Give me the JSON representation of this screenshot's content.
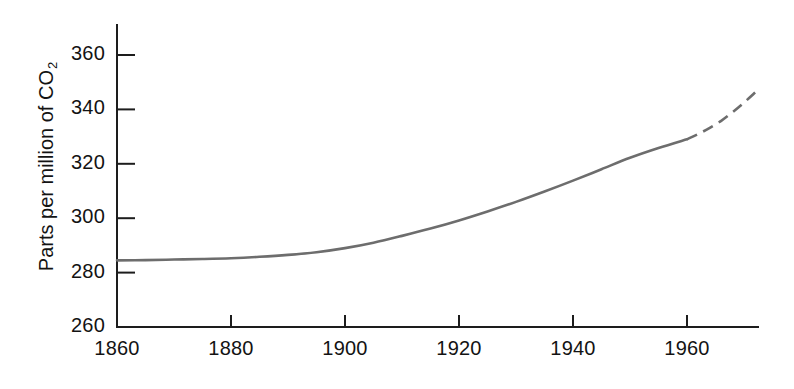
{
  "figure": {
    "background_color": "#ffffff",
    "axis_color": "#1d1d1d",
    "series_color": "#6d6d6d"
  },
  "chart_data": {
    "type": "line",
    "title": "",
    "subtitle": "",
    "xlabel": "",
    "ylabel_plain": "Parts per million of CO2",
    "ylabel_main": "Parts per million of CO",
    "ylabel_sub": "2",
    "xlim": [
      1860,
      1972
    ],
    "ylim": [
      260,
      360
    ],
    "grid": false,
    "legend": "none",
    "x_ticks": [
      1860,
      1880,
      1900,
      1920,
      1940,
      1960
    ],
    "x_tick_labels": [
      "1860",
      "1880",
      "1900",
      "1920",
      "1940",
      "1960"
    ],
    "y_ticks": [
      260,
      280,
      300,
      320,
      340,
      360
    ],
    "y_tick_labels": [
      "260",
      "280",
      "300",
      "320",
      "340",
      "360"
    ],
    "series": [
      {
        "name": "Atmospheric CO2 concentration (measured)",
        "style": "solid",
        "x": [
          1860,
          1865,
          1870,
          1875,
          1880,
          1885,
          1890,
          1895,
          1900,
          1905,
          1910,
          1915,
          1920,
          1925,
          1930,
          1935,
          1940,
          1945,
          1950,
          1955,
          1960
        ],
        "values": [
          284.5,
          284.6,
          284.8,
          285.0,
          285.3,
          285.8,
          286.5,
          287.5,
          289.0,
          291.0,
          293.5,
          296.2,
          299.2,
          302.5,
          306.0,
          309.8,
          313.8,
          318.0,
          322.2,
          325.8,
          329.0
        ]
      },
      {
        "name": "Atmospheric CO2 concentration (projected)",
        "style": "dashed",
        "x": [
          1960,
          1962,
          1964,
          1966,
          1968,
          1970,
          1972
        ],
        "values": [
          329.0,
          331.0,
          333.2,
          335.8,
          339.0,
          342.5,
          346.3
        ]
      }
    ]
  }
}
